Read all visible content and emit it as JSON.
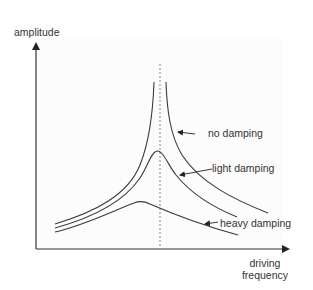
{
  "diagram": {
    "y_axis_label": "amplitude",
    "x_axis_label_line1": "driving",
    "x_axis_label_line2": "frequency",
    "resonance_marker": "dashed vertical line at natural frequency",
    "curves": [
      {
        "id": "no-damping",
        "label": "no damping",
        "peak": "unbounded at natural frequency"
      },
      {
        "id": "light-damping",
        "label": "light damping",
        "peak": "high peak near natural frequency"
      },
      {
        "id": "heavy-damping",
        "label": "heavy damping",
        "peak": "low broad peak below natural frequency"
      }
    ],
    "colors": {
      "line": "#3a3a3a",
      "dashed": "#888888",
      "panel": "#fcfcfc"
    }
  }
}
